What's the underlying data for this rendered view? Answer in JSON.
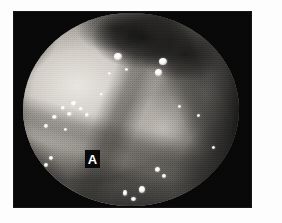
{
  "figure": {
    "caption_label": "A",
    "modality": "endoscopy",
    "color_mode": "grayscale",
    "panel_label_text": "A"
  },
  "canvas": {
    "width": 282,
    "height": 223,
    "background_color": "#fdfdfd"
  },
  "photo_plate": {
    "x": 13,
    "y": 11,
    "width": 239,
    "height": 197,
    "background_color": "#080808"
  },
  "endoscope_field": {
    "shape": "circle",
    "x": 10,
    "y": 2,
    "width": 216,
    "height": 193,
    "vignette": "true",
    "bright_region": "left-of-centre mucosal bulge",
    "dark_region": "upper centre-right lumen and right flank"
  },
  "panel_label": {
    "text": "A",
    "x": 72,
    "y": 139,
    "width": 15,
    "height": 18,
    "text_color": "#ffffff",
    "box_color": "#090909"
  },
  "colors": {
    "paper": "#fdfdfd",
    "plate_black": "#080808",
    "mucosa_bright": "#e9e6e0",
    "mucosa_mid": "#a7a39c",
    "mucosa_shadow": "#4a4845",
    "lumen_dark": "#0d0d0d",
    "highlight_white": "#ffffff"
  },
  "highlights": [
    {
      "x": 101,
      "y": 42,
      "w": 8,
      "h": 7
    },
    {
      "x": 146,
      "y": 47,
      "w": 8,
      "h": 7
    },
    {
      "x": 142,
      "y": 58,
      "w": 7,
      "h": 7
    },
    {
      "x": 112,
      "y": 57,
      "w": 3,
      "h": 3
    },
    {
      "x": 95,
      "y": 61,
      "w": 3,
      "h": 3
    },
    {
      "x": 58,
      "y": 90,
      "w": 6,
      "h": 5
    },
    {
      "x": 48,
      "y": 95,
      "w": 4,
      "h": 4
    },
    {
      "x": 66,
      "y": 96,
      "w": 4,
      "h": 4
    },
    {
      "x": 54,
      "y": 101,
      "w": 5,
      "h": 4
    },
    {
      "x": 72,
      "y": 102,
      "w": 4,
      "h": 4
    },
    {
      "x": 39,
      "y": 104,
      "w": 5,
      "h": 4
    },
    {
      "x": 31,
      "y": 113,
      "w": 4,
      "h": 4
    },
    {
      "x": 51,
      "y": 117,
      "w": 3,
      "h": 3
    },
    {
      "x": 165,
      "y": 94,
      "w": 3,
      "h": 3
    },
    {
      "x": 184,
      "y": 103,
      "w": 3,
      "h": 3
    },
    {
      "x": 36,
      "y": 145,
      "w": 4,
      "h": 4
    },
    {
      "x": 31,
      "y": 152,
      "w": 4,
      "h": 4
    },
    {
      "x": 142,
      "y": 156,
      "w": 5,
      "h": 5
    },
    {
      "x": 149,
      "y": 163,
      "w": 4,
      "h": 4
    },
    {
      "x": 126,
      "y": 175,
      "w": 6,
      "h": 7
    },
    {
      "x": 110,
      "y": 179,
      "w": 4,
      "h": 6
    },
    {
      "x": 118,
      "y": 186,
      "w": 5,
      "h": 4
    },
    {
      "x": 199,
      "y": 135,
      "w": 3,
      "h": 3
    },
    {
      "x": 87,
      "y": 82,
      "w": 3,
      "h": 3
    }
  ]
}
